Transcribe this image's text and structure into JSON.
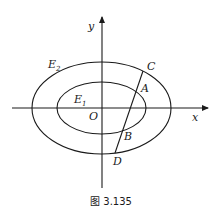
{
  "figure": {
    "caption": "图 3.135",
    "axes": {
      "x_label": "x",
      "y_label": "y",
      "origin_label": "O"
    },
    "curves": [
      {
        "name": "E",
        "sub": "2",
        "type": "ellipse",
        "role": "outer"
      },
      {
        "name": "E",
        "sub": "1",
        "type": "ellipse",
        "role": "inner"
      }
    ],
    "points": {
      "A": "A",
      "B": "B",
      "C": "C",
      "D": "D"
    },
    "colors": {
      "stroke": "#1a1a1a",
      "background": "#ffffff"
    }
  }
}
